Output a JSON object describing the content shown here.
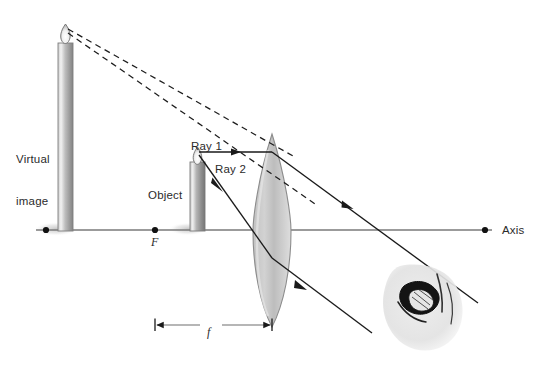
{
  "figure": {
    "type": "optics-ray-diagram",
    "background_color": "#ffffff",
    "line_color": "#1a1a1a",
    "axis_color": "#6e6e6e",
    "lens_fill_light": "#e9e9e9",
    "lens_fill_dark": "#b8b8b8",
    "candle_body_color": "#9a9a9a",
    "shadow_color": "#d9d9d9"
  },
  "labels": {
    "virtual_image_line1": "Virtual",
    "virtual_image_line2": "image",
    "object": "Object",
    "ray1": "Ray 1",
    "ray2": "Ray 2",
    "axis": "Axis",
    "focal_point": "F",
    "focal_length": "f"
  },
  "geometry": {
    "axis_y": 230,
    "axis_x_start": 36,
    "axis_x_end": 492,
    "axis_end_dot_x": 485,
    "image_focal_dot_x": 46,
    "focal_point_dot_x": 155,
    "lens_center_x": 272,
    "lens_top_y": 134,
    "lens_bottom_y": 327,
    "lens_half_width": 19,
    "object_candle": {
      "x_left": 190,
      "x_right": 205,
      "top_y": 162,
      "bottom_y": 231,
      "flame_tip_y": 150
    },
    "virtual_image_candle": {
      "x_left": 58,
      "x_right": 73,
      "top_y": 43,
      "bottom_y": 231,
      "flame_tip_y": 26
    },
    "focal_dimension": {
      "y": 325,
      "x_left": 155,
      "x_right": 272
    },
    "ray1": {
      "from_x": 197,
      "from_y": 152,
      "lens_x": 272,
      "lens_y": 152,
      "end_x": 470,
      "end_y": 297,
      "arrow_positions": [
        "240,152",
        "350,209"
      ]
    },
    "ray2": {
      "from_x": 197,
      "from_y": 152,
      "lens_x": 272,
      "lens_y": 258,
      "end_x": 372,
      "end_y": 332,
      "arrow_positions": [
        "228,175",
        "300,285"
      ]
    },
    "dashed_ray1_back": {
      "from_x": 66,
      "from_y": 31,
      "to_x": 272,
      "to_y": 152
    },
    "dashed_ray2_back": {
      "from_x": 66,
      "from_y": 33,
      "to_x": 290,
      "to_y": 165
    },
    "eye": {
      "center_x": 428,
      "center_y": 300,
      "width": 85,
      "height": 75
    }
  }
}
